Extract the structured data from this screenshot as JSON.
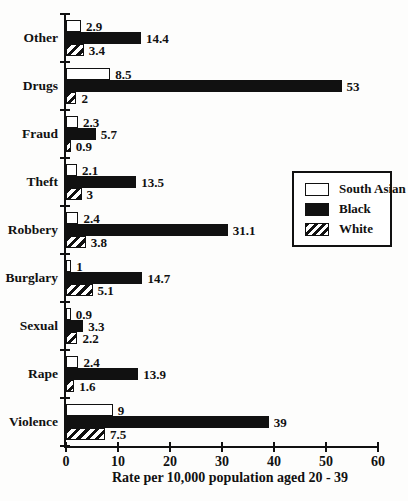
{
  "chart_data": {
    "type": "bar",
    "orientation": "horizontal",
    "xlabel": "Rate per 10,000 population aged 20 - 39",
    "xlim": [
      0,
      60
    ],
    "xticks": [
      0,
      10,
      20,
      30,
      40,
      50,
      60
    ],
    "grid": false,
    "categories": [
      "Other",
      "Drugs",
      "Fraud",
      "Theft",
      "Robbery",
      "Burglary",
      "Sexual",
      "Rape",
      "Violence"
    ],
    "series": [
      {
        "name": "South Asian",
        "style": "white",
        "values": [
          2.9,
          8.5,
          2.3,
          2.1,
          2.4,
          1,
          0.9,
          2.4,
          9
        ]
      },
      {
        "name": "Black",
        "style": "black",
        "values": [
          14.4,
          53,
          5.7,
          13.5,
          31.1,
          14.7,
          3.3,
          13.9,
          39
        ]
      },
      {
        "name": "White",
        "style": "hatched",
        "values": [
          3.4,
          2,
          0.9,
          3,
          3.8,
          5.1,
          2.2,
          1.6,
          7.5
        ]
      }
    ],
    "legend": {
      "position": "right-middle",
      "entries": [
        {
          "label": "South Asian",
          "style": "white"
        },
        {
          "label": "Black",
          "style": "black"
        },
        {
          "label": "White",
          "style": "hatched"
        }
      ]
    }
  },
  "colors": {
    "ink": "#111111",
    "background": "#fdfdfc"
  }
}
